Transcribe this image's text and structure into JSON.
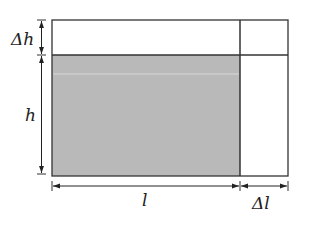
{
  "diagram": {
    "colors": {
      "shaded": "#b9b9b9",
      "stroke": "#333333",
      "background": "#ffffff"
    },
    "labels": {
      "delta_h": "Δh",
      "h": "h",
      "l": "l",
      "delta_l": "Δl"
    },
    "regions": [
      {
        "name": "original-area",
        "label": "l × h",
        "shaded": true
      },
      {
        "name": "top-strip",
        "label": "l × Δh",
        "shaded": false
      },
      {
        "name": "right-strip",
        "label": "Δl × h",
        "shaded": false
      },
      {
        "name": "corner",
        "label": "Δl × Δh",
        "shaded": false
      }
    ]
  }
}
